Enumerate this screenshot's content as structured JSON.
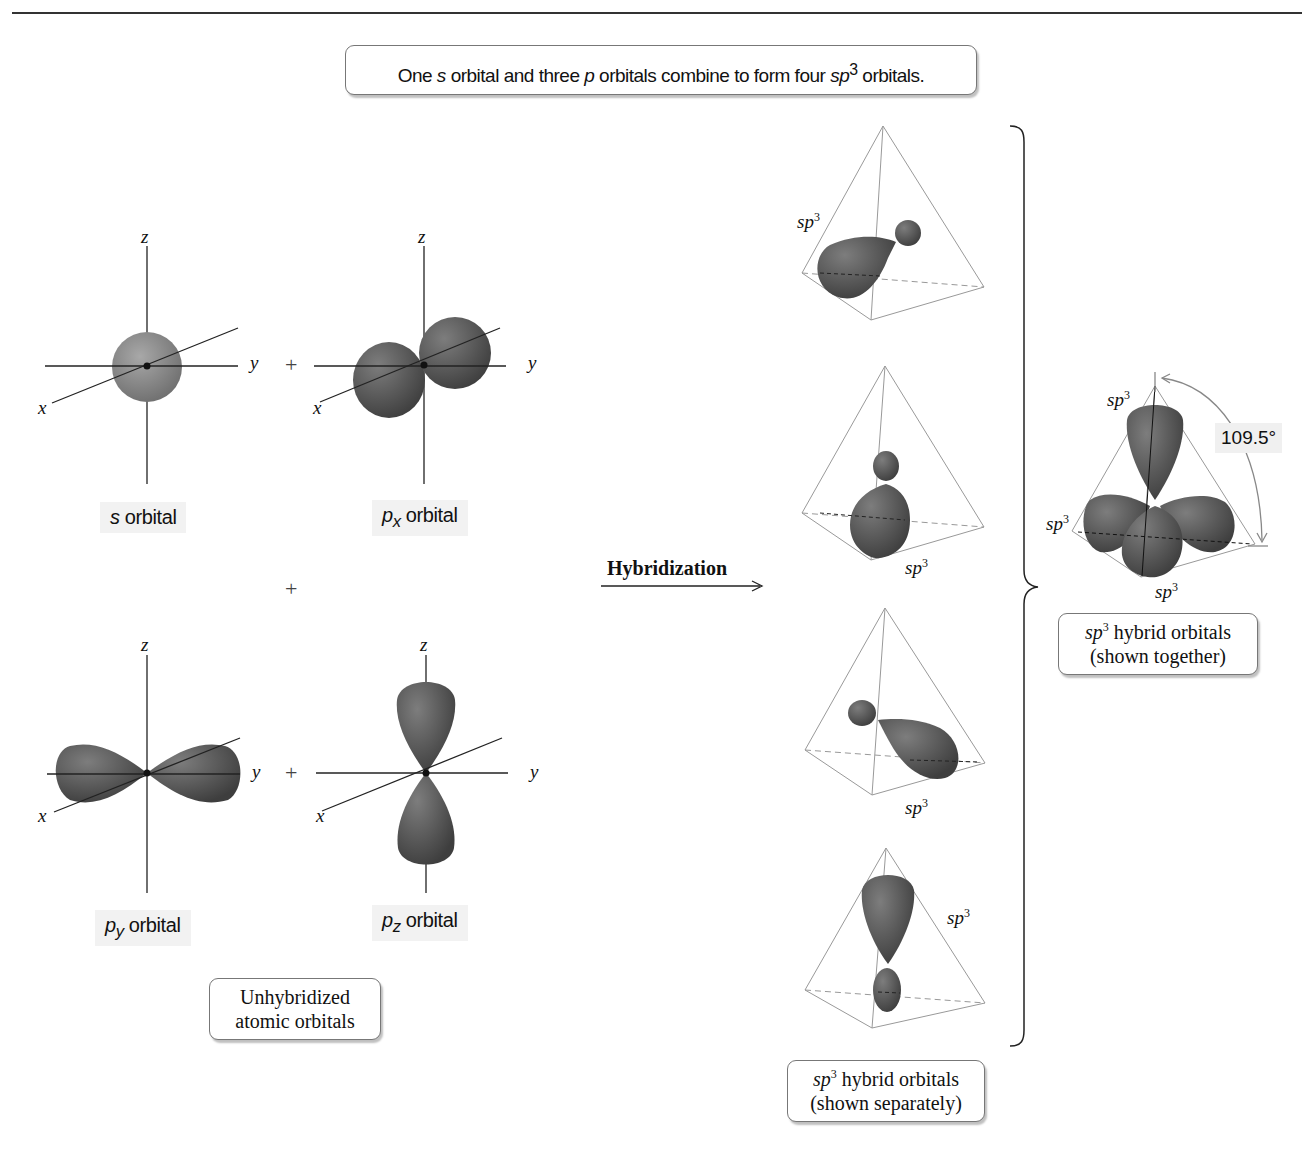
{
  "header": {
    "headline_parts": {
      "a": "One ",
      "s": "s",
      "b": " orbital and three ",
      "p": "p",
      "c": " orbitals combine to form four ",
      "sp": "sp",
      "sup": "3",
      "d": " orbitals."
    }
  },
  "unhybridized": {
    "axis_labels": {
      "x": "x",
      "y": "y",
      "z": "z"
    },
    "plus_sign": "+",
    "orbitals": [
      {
        "id": "s",
        "symbol": "s",
        "subscript": "",
        "suffix": " orbital"
      },
      {
        "id": "px",
        "symbol": "p",
        "subscript": "x",
        "suffix": " orbital"
      },
      {
        "id": "py",
        "symbol": "p",
        "subscript": "y",
        "suffix": " orbital"
      },
      {
        "id": "pz",
        "symbol": "p",
        "subscript": "z",
        "suffix": " orbital"
      }
    ],
    "caption_line1": "Unhybridized",
    "caption_line2": "atomic orbitals"
  },
  "process": {
    "arrow_label": "Hybridization"
  },
  "hybrid_separate": {
    "label_base": "sp",
    "label_sup": "3",
    "caption_line1_rest": " hybrid orbitals",
    "caption_line2": "(shown separately)"
  },
  "hybrid_together": {
    "label_base": "sp",
    "label_sup": "3",
    "bond_angle": "109.5°",
    "caption_line1_rest": " hybrid orbitals",
    "caption_line2": "(shown together)"
  },
  "colors": {
    "orbital_fill": "#5a5a5a",
    "s_orbital_fill": "#8a8a8a",
    "line": "#222222",
    "tetra_line": "#9a9a9a",
    "label_bg": "#f2f2f2"
  }
}
